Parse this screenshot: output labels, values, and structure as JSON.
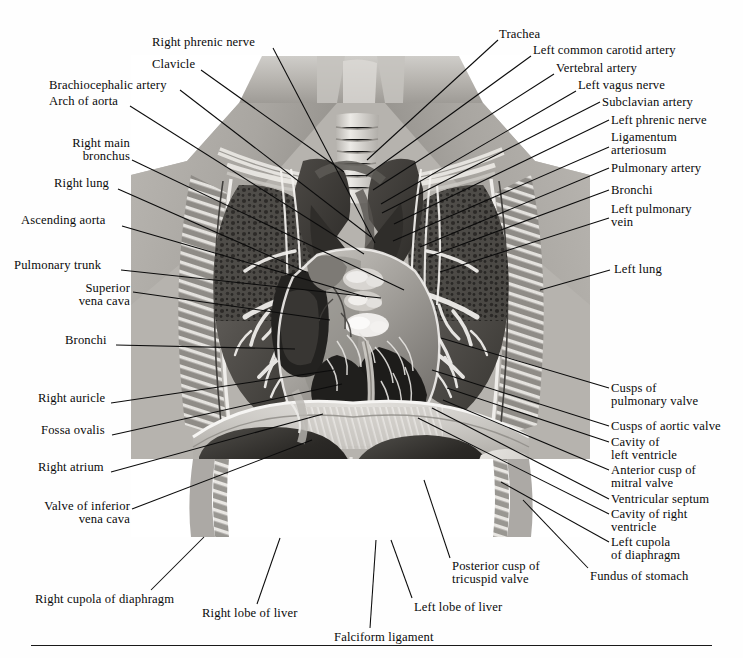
{
  "figure": {
    "kind": "grayscale-anatomical-dissection",
    "frame": {
      "left": 131,
      "top": 55,
      "width": 459,
      "height": 482
    },
    "background_color": "#ffffff",
    "ink_color": "#0a0a0a"
  },
  "rule": {
    "visible": true
  },
  "labels": [
    {
      "id": "right-phrenic-nerve",
      "text": "Right phrenic nerve",
      "lines": [
        "Right phrenic nerve"
      ],
      "align": "left",
      "x": 152,
      "y": 36,
      "leader": [
        [
          273,
          48
        ],
        [
          375,
          243
        ]
      ]
    },
    {
      "id": "clavicle",
      "text": "Clavicle",
      "lines": [
        "Clavicle"
      ],
      "align": "left",
      "x": 152,
      "y": 58,
      "leader": [
        [
          201,
          70
        ],
        [
          344,
          172
        ]
      ]
    },
    {
      "id": "brachiocephalic-artery",
      "text": "Brachiocephalic artery",
      "lines": [
        "Brachiocephalic artery"
      ],
      "align": "left",
      "x": 49,
      "y": 79,
      "leader": [
        [
          180,
          90
        ],
        [
          371,
          237
        ]
      ]
    },
    {
      "id": "arch-of-aorta",
      "text": "Arch of aorta",
      "lines": [
        "Arch of aorta"
      ],
      "align": "left",
      "x": 49,
      "y": 95,
      "leader": [
        [
          130,
          106
        ],
        [
          364,
          254
        ]
      ]
    },
    {
      "id": "right-main-bronchus",
      "text": "Right main bronchus",
      "lines": [
        "Right main",
        "bronchus"
      ],
      "align": "right",
      "x": 47,
      "y": 137,
      "width": 83,
      "leader": [
        [
          132,
          160
        ],
        [
          404,
          290
        ]
      ]
    },
    {
      "id": "right-lung",
      "text": "Right lung",
      "lines": [
        "Right lung"
      ],
      "align": "left",
      "x": 54,
      "y": 177,
      "leader": [
        [
          118,
          189
        ],
        [
          306,
          272
        ]
      ]
    },
    {
      "id": "ascending-aorta",
      "text": "Ascending aorta",
      "lines": [
        "Ascending aorta"
      ],
      "align": "left",
      "x": 21,
      "y": 214,
      "leader": [
        [
          122,
          226
        ],
        [
          366,
          297
        ]
      ]
    },
    {
      "id": "pulmonary-trunk",
      "text": "Pulmonary trunk",
      "lines": [
        "Pulmonary trunk"
      ],
      "align": "left",
      "x": 14,
      "y": 259,
      "leader": [
        [
          121,
          270
        ],
        [
          381,
          298
        ]
      ]
    },
    {
      "id": "superior-vena-cava",
      "text": "Superior vena cava",
      "lines": [
        "Superior",
        "vena cava"
      ],
      "align": "right",
      "x": 56,
      "y": 282,
      "width": 74,
      "leader": [
        [
          133,
          292
        ],
        [
          330,
          320
        ]
      ]
    },
    {
      "id": "bronchi-right",
      "text": "Bronchi",
      "lines": [
        "Bronchi"
      ],
      "align": "left",
      "x": 65,
      "y": 334,
      "leader": [
        [
          116,
          345
        ],
        [
          295,
          349
        ]
      ]
    },
    {
      "id": "right-auricle",
      "text": "Right auricle",
      "lines": [
        "Right auricle"
      ],
      "align": "left",
      "x": 38,
      "y": 392,
      "leader": [
        [
          111,
          403
        ],
        [
          334,
          370
        ]
      ]
    },
    {
      "id": "fossa-ovalis",
      "text": "Fossa ovalis",
      "lines": [
        "Fossa ovalis"
      ],
      "align": "left",
      "x": 41,
      "y": 424,
      "leader": [
        [
          112,
          435
        ],
        [
          342,
          384
        ]
      ]
    },
    {
      "id": "right-atrium",
      "text": "Right atrium",
      "lines": [
        "Right atrium"
      ],
      "align": "left",
      "x": 38,
      "y": 461,
      "leader": [
        [
          111,
          472
        ],
        [
          323,
          414
        ]
      ]
    },
    {
      "id": "valve-of-inferior-vena-cava",
      "text": "Valve of inferior vena cava",
      "lines": [
        "Valve of inferior",
        "vena cava"
      ],
      "align": "right",
      "x": 18,
      "y": 500,
      "width": 112,
      "leader": [
        [
          132,
          509
        ],
        [
          312,
          440
        ]
      ]
    },
    {
      "id": "right-cupola-of-diaphragm",
      "text": "Right cupola of diaphragm",
      "lines": [
        "Right cupola of diaphragm"
      ],
      "align": "left",
      "x": 35,
      "y": 593,
      "leader": [
        [
          151,
          590
        ],
        [
          204,
          537
        ]
      ]
    },
    {
      "id": "right-lobe-of-liver",
      "text": "Right lobe of liver",
      "lines": [
        "Right lobe of liver"
      ],
      "align": "left",
      "x": 202,
      "y": 607,
      "leader": [
        [
          257,
          604
        ],
        [
          280,
          538
        ]
      ]
    },
    {
      "id": "falciform-ligament",
      "text": "Falciform ligament",
      "lines": [
        "Falciform ligament"
      ],
      "align": "left",
      "x": 334,
      "y": 631,
      "leader": [
        [
          370,
          628
        ],
        [
          376,
          540
        ]
      ]
    },
    {
      "id": "trachea",
      "text": "Trachea",
      "lines": [
        "Trachea"
      ],
      "align": "left",
      "x": 499,
      "y": 28,
      "leader": [
        [
          498,
          40
        ],
        [
          367,
          160
        ]
      ]
    },
    {
      "id": "left-common-carotid-artery",
      "text": "Left common carotid artery",
      "lines": [
        "Left common carotid artery"
      ],
      "align": "left",
      "x": 533,
      "y": 44,
      "leader": [
        [
          531,
          56
        ],
        [
          366,
          176
        ]
      ]
    },
    {
      "id": "vertebral-artery",
      "text": "Vertebral artery",
      "lines": [
        "Vertebral artery"
      ],
      "align": "left",
      "x": 556,
      "y": 62,
      "leader": [
        [
          554,
          74
        ],
        [
          373,
          190
        ]
      ]
    },
    {
      "id": "left-vagus-nerve",
      "text": "Left vagus nerve",
      "lines": [
        "Left vagus nerve"
      ],
      "align": "left",
      "x": 578,
      "y": 79,
      "leader": [
        [
          576,
          91
        ],
        [
          381,
          204
        ]
      ]
    },
    {
      "id": "subclavian-artery",
      "text": "Subclavian artery",
      "lines": [
        "Subclavian artery"
      ],
      "align": "left",
      "x": 602,
      "y": 96,
      "leader": [
        [
          600,
          102
        ],
        [
          382,
          213
        ]
      ]
    },
    {
      "id": "left-phrenic-nerve",
      "text": "Left phrenic nerve",
      "lines": [
        "Left phrenic nerve"
      ],
      "align": "left",
      "x": 611,
      "y": 114,
      "leader": [
        [
          609,
          120
        ],
        [
          394,
          224
        ]
      ]
    },
    {
      "id": "ligamentum-arteriosum",
      "text": "Ligamentum arteriosum",
      "lines": [
        "Ligamentum",
        "arteriosum"
      ],
      "align": "left",
      "x": 611,
      "y": 131,
      "leader": [
        [
          609,
          147
        ],
        [
          393,
          241
        ]
      ]
    },
    {
      "id": "pulmonary-artery",
      "text": "Pulmonary artery",
      "lines": [
        "Pulmonary artery"
      ],
      "align": "left",
      "x": 611,
      "y": 162,
      "leader": [
        [
          609,
          168
        ],
        [
          420,
          247
        ]
      ]
    },
    {
      "id": "bronchi-left",
      "text": "Bronchi",
      "lines": [
        "Bronchi"
      ],
      "align": "left",
      "x": 611,
      "y": 184,
      "leader": [
        [
          609,
          190
        ],
        [
          428,
          257
        ]
      ]
    },
    {
      "id": "left-pulmonary-vein",
      "text": "Left pulmonary vein",
      "lines": [
        "Left pulmonary",
        "vein"
      ],
      "align": "left",
      "x": 611,
      "y": 203,
      "leader": [
        [
          609,
          218
        ],
        [
          440,
          272
        ]
      ]
    },
    {
      "id": "left-lung",
      "text": "Left lung",
      "lines": [
        "Left lung"
      ],
      "align": "left",
      "x": 614,
      "y": 263,
      "leader": [
        [
          610,
          270
        ],
        [
          540,
          290
        ]
      ]
    },
    {
      "id": "cusps-of-pulmonary-valve",
      "text": "Cusps of pulmonary valve",
      "lines": [
        "Cusps of",
        "pulmonary valve"
      ],
      "align": "left",
      "x": 611,
      "y": 382,
      "leader": [
        [
          609,
          388
        ],
        [
          441,
          338
        ]
      ]
    },
    {
      "id": "cusps-of-aortic-valve",
      "text": "Cusps of aortic valve",
      "lines": [
        "Cusps of aortic valve"
      ],
      "align": "left",
      "x": 611,
      "y": 420,
      "leader": [
        [
          609,
          426
        ],
        [
          432,
          370
        ]
      ]
    },
    {
      "id": "cavity-of-left-ventricle",
      "text": "Cavity of left ventricle",
      "lines": [
        "Cavity of",
        "left ventricle"
      ],
      "align": "left",
      "x": 611,
      "y": 436,
      "leader": [
        [
          609,
          442
        ],
        [
          447,
          388
        ]
      ]
    },
    {
      "id": "anterior-cusp-of-mitral-valve",
      "text": "Anterior cusp of mitral valve",
      "lines": [
        "Anterior cusp of",
        "mitral valve"
      ],
      "align": "left",
      "x": 611,
      "y": 464,
      "leader": [
        [
          609,
          470
        ],
        [
          443,
          400
        ]
      ]
    },
    {
      "id": "ventricular-septum",
      "text": "Ventricular septum",
      "lines": [
        "Ventricular septum"
      ],
      "align": "left",
      "x": 611,
      "y": 493,
      "leader": [
        [
          609,
          499
        ],
        [
          432,
          408
        ]
      ]
    },
    {
      "id": "cavity-of-right-ventricle",
      "text": "Cavity of right ventricle",
      "lines": [
        "Cavity of right",
        "ventricle"
      ],
      "align": "left",
      "x": 611,
      "y": 508,
      "leader": [
        [
          609,
          514
        ],
        [
          418,
          418
        ]
      ]
    },
    {
      "id": "left-cupola-of-diaphragm",
      "text": "Left cupola of diaphragm",
      "lines": [
        "Left cupola",
        "of diaphragm"
      ],
      "align": "left",
      "x": 611,
      "y": 536,
      "leader": [
        [
          609,
          542
        ],
        [
          501,
          482
        ]
      ]
    },
    {
      "id": "fundus-of-stomach",
      "text": "Fundus of stomach",
      "lines": [
        "Fundus of stomach"
      ],
      "align": "left",
      "x": 590,
      "y": 570,
      "leader": [
        [
          588,
          568
        ],
        [
          523,
          500
        ]
      ]
    },
    {
      "id": "posterior-cusp-of-tricuspid-valve",
      "text": "Posterior cusp of tricuspid valve",
      "lines": [
        "Posterior cusp of",
        "tricuspid valve"
      ],
      "align": "left",
      "x": 452,
      "y": 560,
      "leader": [
        [
          450,
          558
        ],
        [
          424,
          480
        ]
      ]
    },
    {
      "id": "left-lobe-of-liver",
      "text": "Left lobe of liver",
      "lines": [
        "Left lobe of liver"
      ],
      "align": "left",
      "x": 414,
      "y": 601,
      "leader": [
        [
          412,
          598
        ],
        [
          391,
          540
        ]
      ]
    }
  ]
}
